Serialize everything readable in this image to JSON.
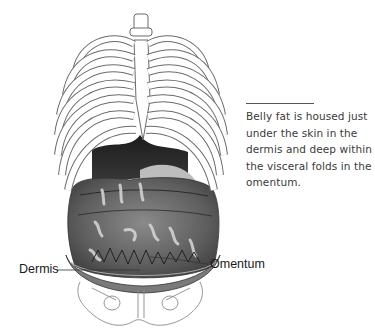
{
  "caption": {
    "text": "Belly fat is housed just under the skin in the dermis and deep within the visceral folds in the omentum."
  },
  "labels": {
    "dermis": "Dermis",
    "omentum": "Omentum"
  },
  "illustration": {
    "subject": "anatomical torso: rib cage, spine, abdominal organs, pelvis",
    "icon": "anatomy-torso-illustration"
  },
  "colors": {
    "line": "#555555",
    "bone_outline": "#6b6b6b",
    "organ_dark": "#2a2a2a",
    "organ_mid": "#6e6e6e",
    "organ_light": "#a8a8a8",
    "text": "#3a3a3a"
  }
}
